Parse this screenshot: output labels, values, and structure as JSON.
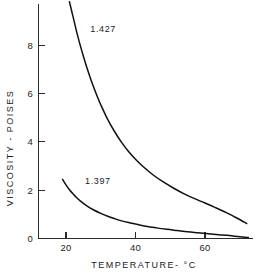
{
  "chart_data": {
    "type": "line",
    "title": "",
    "xlabel": "TEMPERATURE- °C",
    "ylabel": "VISCOSITY - POISES",
    "xlim": [
      12,
      74
    ],
    "ylim": [
      0,
      9.9
    ],
    "grid": false,
    "legend_position": "inline-curve-labels",
    "xticks": [
      20,
      40,
      60
    ],
    "xtick_labels": [
      "20",
      "40",
      "60"
    ],
    "yticks": [
      0,
      2,
      4,
      6,
      8
    ],
    "ytick_labels": [
      "0",
      "2",
      "4",
      "6",
      "8"
    ],
    "series": [
      {
        "name": "1.427",
        "label": "1.427",
        "label_x": 27,
        "label_y": 8.55,
        "color": "#111111",
        "x": [
          21.0,
          22.0,
          23.0,
          24.0,
          25.0,
          26.0,
          27.0,
          28.0,
          29.0,
          30.0,
          32.0,
          34.0,
          36.0,
          38.0,
          40.0,
          42.0,
          45.0,
          48.0,
          51.0,
          54.0,
          57.0,
          60.0,
          63.0,
          66.0,
          69.0,
          72.0
        ],
        "y": [
          9.8,
          9.2,
          8.6,
          8.05,
          7.55,
          7.08,
          6.65,
          6.25,
          5.88,
          5.54,
          4.93,
          4.42,
          3.98,
          3.6,
          3.28,
          3.0,
          2.64,
          2.34,
          2.08,
          1.85,
          1.65,
          1.47,
          1.28,
          1.08,
          0.86,
          0.62
        ]
      },
      {
        "name": "1.397",
        "label": "1.397",
        "label_x": 25.5,
        "label_y": 2.27,
        "color": "#111111",
        "x": [
          19.0,
          20.0,
          21.0,
          22.0,
          23.0,
          24.0,
          26.0,
          28.0,
          30.0,
          32.0,
          34.0,
          36.0,
          38.0,
          40.0,
          43.0,
          46.0,
          49.0,
          52.0,
          55.0,
          58.0,
          61.0,
          64.0,
          67.0,
          70.0,
          72.5
        ],
        "y": [
          2.45,
          2.22,
          2.02,
          1.85,
          1.7,
          1.57,
          1.35,
          1.18,
          1.04,
          0.92,
          0.82,
          0.73,
          0.66,
          0.6,
          0.51,
          0.44,
          0.38,
          0.33,
          0.28,
          0.24,
          0.2,
          0.16,
          0.12,
          0.07,
          0.04
        ]
      }
    ]
  }
}
